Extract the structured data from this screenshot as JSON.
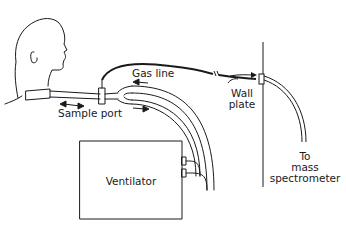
{
  "diagram": {
    "labels": {
      "gas_line": "Gas line",
      "sample_port": "Sample port",
      "wall_plate_1": "Wall",
      "wall_plate_2": "plate",
      "ventilator": "Ventilator",
      "to_1": "To",
      "to_2": "mass",
      "to_3": "spectrometer"
    },
    "colors": {
      "line": "#1a1a1a",
      "background": "#ffffff"
    }
  }
}
